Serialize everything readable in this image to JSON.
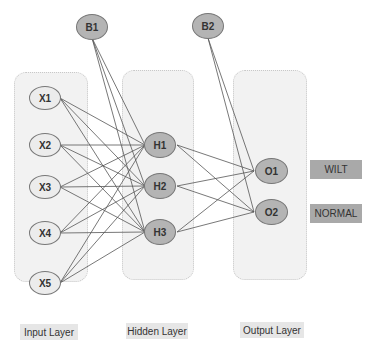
{
  "diagram": {
    "type": "neural-network",
    "layers": [
      {
        "name": "Input Layer",
        "nodes": [
          "X1",
          "X2",
          "X3",
          "X4",
          "X5"
        ]
      },
      {
        "name": "Hidden Layer",
        "nodes": [
          "H1",
          "H2",
          "H3"
        ]
      },
      {
        "name": "Output Layer",
        "nodes": [
          "O1",
          "O2"
        ]
      }
    ],
    "bias_nodes": [
      "B1",
      "B2"
    ],
    "output_classes": [
      "WILT",
      "NORMAL"
    ],
    "colors": {
      "node_fill": "#b4b4b4",
      "input_fill": "#ececec",
      "layer_bg": "#f2f2f2",
      "class_box": "#a9a9a9"
    }
  },
  "labels": {
    "input_layer": "Input Layer",
    "hidden_layer": "Hidden Layer",
    "output_layer": "Output Layer",
    "b1": "B1",
    "b2": "B2",
    "x1": "X1",
    "x2": "X2",
    "x3": "X3",
    "x4": "X4",
    "x5": "X5",
    "h1": "H1",
    "h2": "H2",
    "h3": "H3",
    "o1": "O1",
    "o2": "O2",
    "wilt": "WILT",
    "normal": "NORMAL"
  }
}
